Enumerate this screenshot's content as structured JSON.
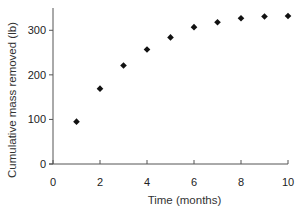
{
  "chart_data": {
    "type": "scatter",
    "title": "",
    "xlabel": "Time (months)",
    "ylabel": "Cumulative mass removed (lb)",
    "xlim": [
      0,
      10
    ],
    "ylim": [
      0,
      350
    ],
    "xticks": [
      0,
      2,
      4,
      6,
      8,
      10
    ],
    "yticks": [
      0,
      100,
      200,
      300
    ],
    "grid": false,
    "legend": null,
    "marker": "diamond",
    "marker_color": "#111111",
    "series": [
      {
        "name": "Cumulative mass removed",
        "x": [
          1,
          2,
          3,
          4,
          5,
          6,
          7,
          8,
          9,
          10
        ],
        "y": [
          95,
          169,
          221,
          257,
          284,
          307,
          318,
          327,
          331,
          332
        ]
      }
    ]
  }
}
